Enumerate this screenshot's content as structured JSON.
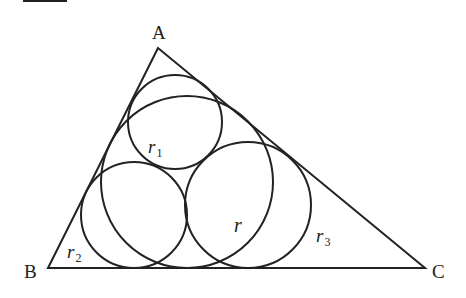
{
  "figure": {
    "vertices": {
      "A": {
        "label": "A",
        "x": 158,
        "y": 48
      },
      "B": {
        "label": "B",
        "x": 48,
        "y": 268
      },
      "C": {
        "label": "C",
        "x": 425,
        "y": 268
      }
    },
    "circles": {
      "incircle": {
        "label": "r",
        "cx": 187,
        "cy": 182,
        "r": 86
      },
      "circle_A": {
        "label": "r",
        "sub": "1",
        "cx": 175,
        "cy": 122,
        "r": 47
      },
      "circle_B": {
        "label": "r",
        "sub": "2",
        "cx": 134,
        "cy": 215,
        "r": 53
      },
      "circle_C": {
        "label": "r",
        "sub": "3",
        "cx": 248,
        "cy": 205,
        "r": 63
      }
    },
    "labels": {
      "A": "A",
      "B": "B",
      "C": "C",
      "r": "r",
      "r1_main": "r",
      "r1_sub": "1",
      "r2_main": "r",
      "r2_sub": "2",
      "r3_main": "r",
      "r3_sub": "3"
    },
    "colors": {
      "stroke": "#222222",
      "background": "#ffffff"
    }
  }
}
